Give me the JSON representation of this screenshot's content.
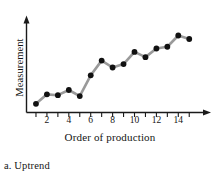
{
  "figure": {
    "caption": "a. Uptrend"
  },
  "chart_data": {
    "type": "line",
    "title": "",
    "subtitle": "",
    "xlabel": "Order of production",
    "ylabel": "Measurement",
    "x": [
      1,
      2,
      3,
      4,
      5,
      6,
      7,
      8,
      9,
      10,
      11,
      12,
      13,
      14,
      15
    ],
    "values": [
      0.1,
      0.21,
      0.2,
      0.26,
      0.19,
      0.43,
      0.6,
      0.52,
      0.56,
      0.7,
      0.64,
      0.74,
      0.76,
      0.89,
      0.85
    ],
    "xtick_labels": [
      "2",
      "4",
      "6",
      "8",
      "10",
      "12",
      "14"
    ],
    "xtick_values": [
      2,
      4,
      6,
      8,
      10,
      12,
      14
    ],
    "xminor_ticks": [
      1,
      2,
      3,
      4,
      5,
      6,
      7,
      8,
      9,
      10,
      11,
      12,
      13,
      14,
      15
    ],
    "ytick_labels": [],
    "xlim": [
      0.5,
      15.8
    ],
    "ylim": [
      0,
      1
    ],
    "grid": false,
    "legend": null,
    "annotations": [],
    "marker": "filled-circle",
    "marker_color": "#111111",
    "line_color": "#9a9a9a",
    "axis_color": "#1a1a1a"
  }
}
